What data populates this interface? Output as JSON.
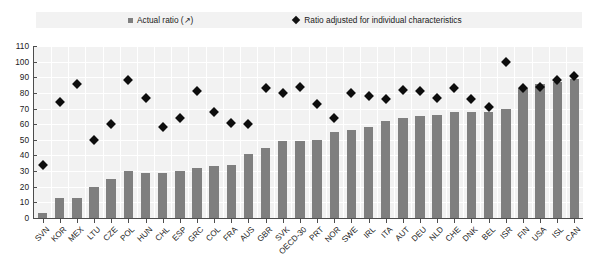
{
  "legend": {
    "entries": [
      {
        "label": "Actual ratio (↗)",
        "marker": "square-marker-icon",
        "color": "#7f7f7f"
      },
      {
        "label": "Ratio adjusted for individual characteristics",
        "marker": "diamond-marker-icon",
        "color": "#0d0d0d"
      }
    ]
  },
  "chart_data": {
    "type": "bar",
    "title": "",
    "subtitle": "",
    "xlabel": "",
    "ylabel": "",
    "ylim": [
      0,
      110
    ],
    "ytick_step": 10,
    "yticks": [
      110,
      100,
      90,
      80,
      70,
      60,
      50,
      40,
      30,
      20,
      10,
      0
    ],
    "grid": true,
    "legend_position": "top",
    "categories": [
      "SVN",
      "KOR",
      "MEX",
      "LTU",
      "CZE",
      "POL",
      "HUN",
      "CHL",
      "ESP",
      "GRC",
      "COL",
      "FRA",
      "AUS",
      "GBR",
      "SVK",
      "OECD-30",
      "PRT",
      "NOR",
      "SWE",
      "IRL",
      "ITA",
      "AUT",
      "DEU",
      "NLD",
      "CHE",
      "DNK",
      "BEL",
      "ISR",
      "FIN",
      "USA",
      "ISL",
      "CAN"
    ],
    "series": [
      {
        "name": "Actual ratio (↗)",
        "type": "bar",
        "color": "#7f7f7f",
        "values": [
          3,
          13,
          13,
          20,
          25,
          30,
          29,
          29,
          30,
          32,
          33,
          34,
          41,
          45,
          49,
          49,
          50,
          55,
          56,
          58,
          62,
          64,
          65,
          66,
          68,
          68,
          68,
          70,
          83,
          86,
          87,
          89
        ]
      },
      {
        "name": "Ratio adjusted for individual characteristics",
        "type": "scatter",
        "color": "#0d0d0d",
        "marker": "diamond",
        "values": [
          34,
          74,
          86,
          50,
          60,
          88,
          77,
          58,
          64,
          81,
          68,
          61,
          60,
          83,
          80,
          84,
          73,
          64,
          80,
          78,
          76,
          82,
          81,
          77,
          83,
          76,
          71,
          100,
          83,
          84,
          88,
          91
        ]
      }
    ]
  }
}
